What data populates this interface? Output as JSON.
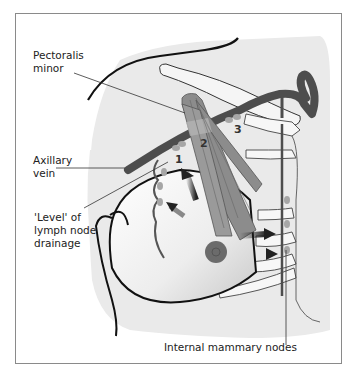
{
  "figure": {
    "type": "anatomical-diagram",
    "labels": {
      "pectoralis_line1": "Pectoralis",
      "pectoralis_line2": "minor",
      "axillary_line1": "Axillary",
      "axillary_line2": "vein",
      "level_line1": "'Level' of",
      "level_line2": "lymph node",
      "level_line3": "drainage",
      "internal_mammary": "Internal mammary nodes"
    },
    "level_numbers": [
      "1",
      "2",
      "3"
    ],
    "colors": {
      "muscle": "#8c8c8c",
      "vein": "#4d4d4d",
      "node": "#a6a6a6",
      "body_shade": "#e8e8e8",
      "outline": "#111111",
      "arrow": "#222222",
      "frame": "#8a8a8a"
    }
  }
}
